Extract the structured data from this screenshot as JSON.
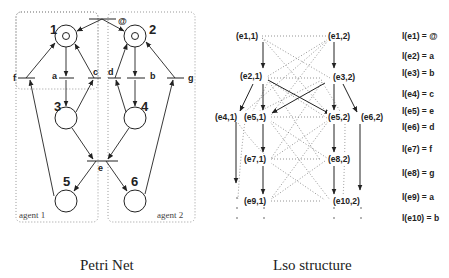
{
  "petri_net": {
    "caption": "Petri Net",
    "agents": [
      "agent 1",
      "agent 2"
    ],
    "places": [
      "1",
      "2",
      "3",
      "4",
      "5",
      "6"
    ],
    "transitions": {
      "at": "@",
      "a": "a",
      "b": "b",
      "c": "c",
      "d": "d",
      "e": "e",
      "f": "f",
      "g": "g"
    }
  },
  "lso": {
    "caption": "Lso structure",
    "events": {
      "e11": "(e1,1)",
      "e12": "(e1,2)",
      "e21": "(e2,1)",
      "e32": "(e3,2)",
      "e41": "(e4,1)",
      "e51": "(e5,1)",
      "e52": "(e5,2)",
      "e62": "(e6,2)",
      "e71": "(e7,1)",
      "e82": "(e8,2)",
      "e91": "(e9,1)",
      "e102": "(e10,2)"
    },
    "labels": [
      "l(e1) = @",
      "l(e2) = a",
      "l(e3) = b",
      "l(e4) = c",
      "l(e5) = e",
      "l(e6) = d",
      "l(e7) = f",
      "l(e8) = g",
      "l(e9) = a",
      "l(e10) = b"
    ]
  }
}
